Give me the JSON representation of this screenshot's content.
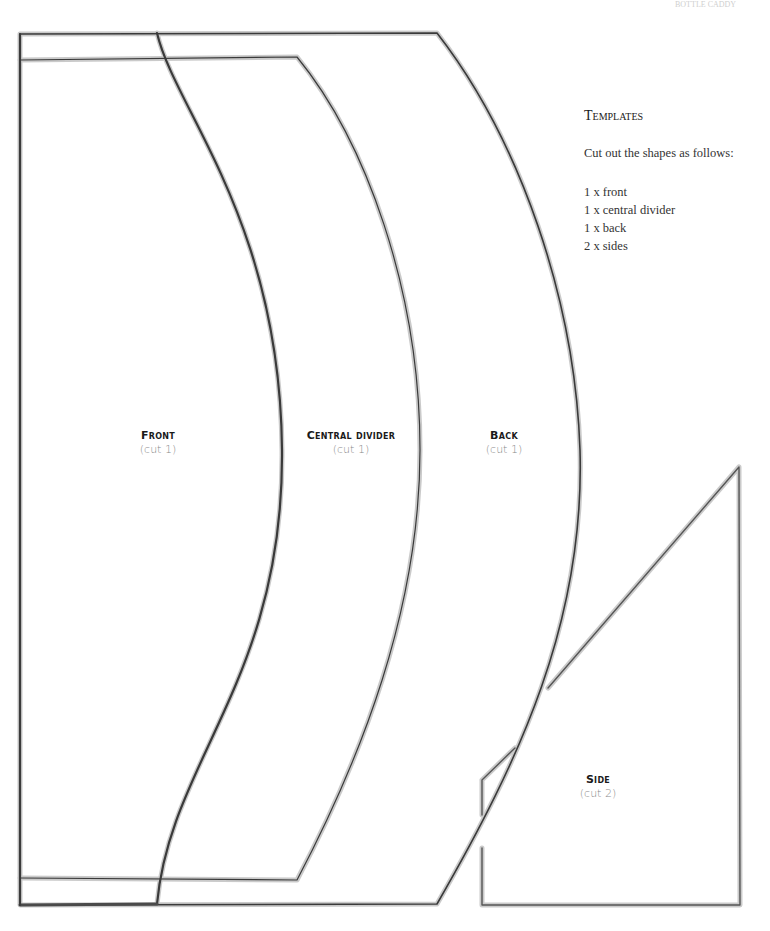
{
  "header": {
    "running_head": "BOTTLE CADDY"
  },
  "instructions": {
    "title": "Templates",
    "intro": "Cut out the shapes as follows:",
    "items": [
      "1 x front",
      "1 x central divider",
      "1 x back",
      "2 x sides"
    ]
  },
  "pieces": [
    {
      "name": "Front",
      "cut": "(cut 1)"
    },
    {
      "name": "Central divider",
      "cut": "(cut 1)"
    },
    {
      "name": "Back",
      "cut": "(cut 1)"
    },
    {
      "name": "Side",
      "cut": "(cut 2)"
    }
  ],
  "colors": {
    "outline_dark": "#3a3a3a",
    "outline_grey": "#9a9a9a",
    "label_text": "#1a1a1a",
    "cut_text": "#8a8a8a"
  }
}
